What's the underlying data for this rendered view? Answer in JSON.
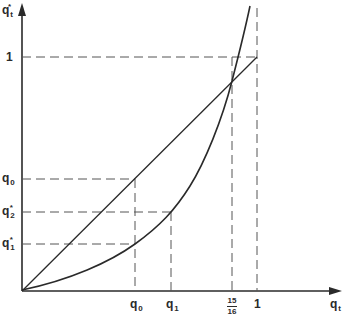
{
  "diagram": {
    "type": "function-plot",
    "x_axis": {
      "label_main": "q",
      "label_sub": "t"
    },
    "y_axis": {
      "label_main": "q",
      "label_sub": "t",
      "label_sup": "*"
    },
    "x_ticks": [
      {
        "main": "q",
        "sub": "0"
      },
      {
        "main": "q",
        "sub": "1"
      },
      {
        "num": "15",
        "den": "16"
      },
      {
        "main": "1"
      }
    ],
    "y_ticks": [
      {
        "main": "1"
      },
      {
        "main": "q",
        "sub": "0"
      },
      {
        "main": "q",
        "sub": "2",
        "sup": "*"
      },
      {
        "main": "q",
        "sub": "1",
        "sup": "*"
      }
    ],
    "curves": [
      {
        "name": "45-degree line",
        "style": "solid",
        "description": "q*_t = q_t"
      },
      {
        "name": "convex mapping",
        "style": "solid",
        "description": "convex curve crossing diagonal at q_t = 15/16"
      }
    ],
    "guides": "dashed projection lines for q0, q1, 15/16, 1 and q1*, q2*, q0, 1",
    "colors": {
      "ink": "#2a2a2a",
      "background": "#ffffff"
    }
  }
}
